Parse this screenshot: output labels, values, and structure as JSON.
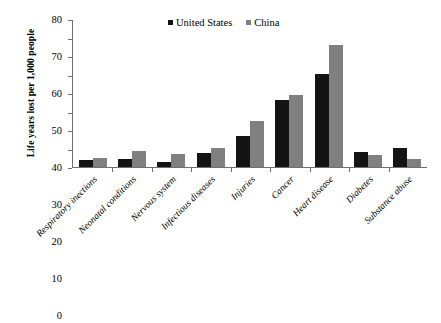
{
  "chart_data": {
    "type": "bar",
    "title": "",
    "subtitle": "",
    "xlabel": "",
    "ylabel": "Life years lost per 1,000 people",
    "ylim": [
      0,
      80
    ],
    "yticks": [
      0,
      10,
      20,
      30,
      40,
      50,
      60,
      70,
      80
    ],
    "grid": false,
    "legend_position": "top-center",
    "orientation": "vertical",
    "grouping": "grouped",
    "categories": [
      "Respiratory inections",
      "Neonatal conditions",
      "Nervous system",
      "Infectious diseases",
      "Injuries",
      "Cancer",
      "Heart disease",
      "Diabetes",
      "Substance abuse"
    ],
    "series": [
      {
        "name": "United States",
        "color": "#141414",
        "values": [
          4.0,
          4.3,
          2.6,
          7.6,
          17.0,
          36.5,
          50.5,
          8.3,
          10.6
        ]
      },
      {
        "name": "China",
        "color": "#808080",
        "values": [
          5.1,
          8.7,
          7.3,
          10.3,
          24.8,
          39.2,
          66.3,
          6.8,
          4.3
        ]
      }
    ]
  },
  "legend": {
    "items": [
      {
        "label": "United States",
        "swatch": "legend-swatch-black"
      },
      {
        "label": "China",
        "swatch": "legend-swatch-gray"
      }
    ]
  }
}
